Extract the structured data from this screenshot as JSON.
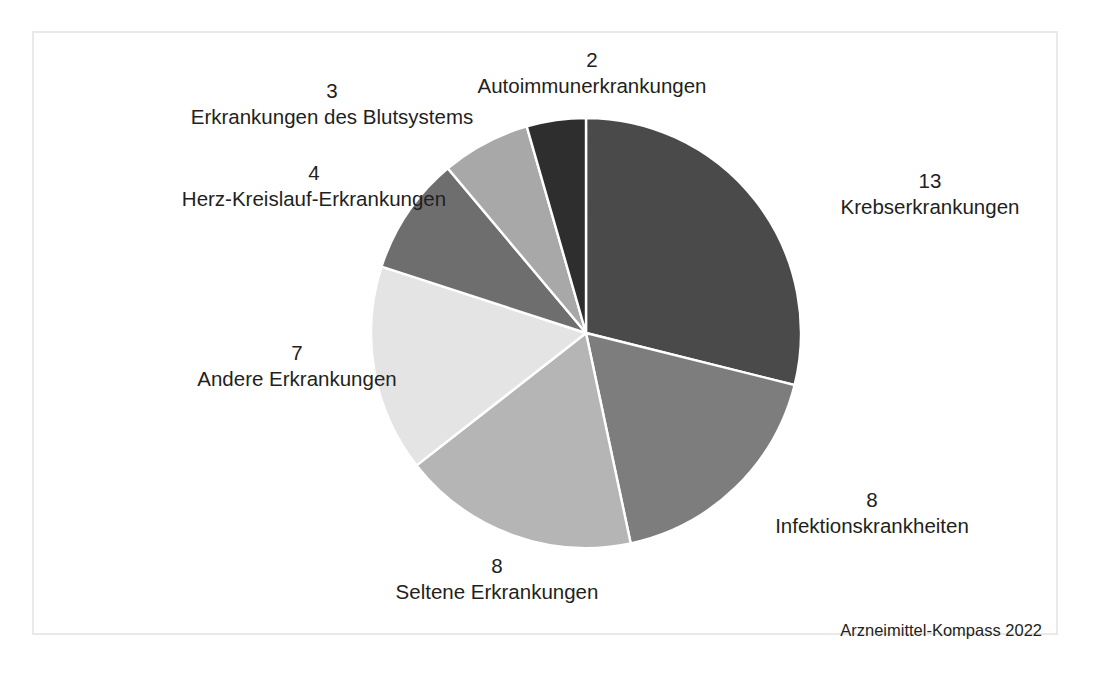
{
  "figure": {
    "source_note": "Arzneimittel-Kompass 2022",
    "frame_color": "#e9e9e9",
    "background_color": "#ffffff",
    "text_color": "#231f20"
  },
  "chart_data": {
    "type": "pie",
    "title": "",
    "subtitle": "",
    "xlabel": "",
    "ylabel": "",
    "total": 45,
    "start_angle_deg": 0,
    "direction": "clockwise",
    "legend_position": "outside-labels",
    "grid": false,
    "annotations": [
      "Arzneimittel-Kompass 2022"
    ],
    "categories": [
      "Krebserkrankungen",
      "Infektionskrankheiten",
      "Seltene Erkrankungen",
      "Andere Erkrankungen",
      "Herz-Kreislauf-Erkrankungen",
      "Erkrankungen des Blutsystems",
      "Autoimmunerkrankungen"
    ],
    "values": [
      13,
      8,
      8,
      7,
      4,
      3,
      2
    ],
    "colors": [
      "#4a4a4a",
      "#7d7d7d",
      "#b5b5b5",
      "#e4e4e4",
      "#6e6e6e",
      "#a8a8a8",
      "#2e2e2e"
    ],
    "slices": [
      {
        "label": "Krebserkrankungen",
        "value": 13,
        "color": "#4a4a4a"
      },
      {
        "label": "Infektionskrankheiten",
        "value": 8,
        "color": "#7d7d7d"
      },
      {
        "label": "Seltene Erkrankungen",
        "value": 8,
        "color": "#b5b5b5"
      },
      {
        "label": "Andere Erkrankungen",
        "value": 7,
        "color": "#e4e4e4"
      },
      {
        "label": "Herz-Kreislauf-Erkrankungen",
        "value": 4,
        "color": "#6e6e6e"
      },
      {
        "label": "Erkrankungen des Blutsystems",
        "value": 3,
        "color": "#a8a8a8"
      },
      {
        "label": "Autoimmunerkrankungen",
        "value": 2,
        "color": "#2e2e2e"
      }
    ]
  },
  "labels": {
    "autoimmun": {
      "value": "2",
      "name": "Autoimmunerkrankungen"
    },
    "blutsystem": {
      "value": "3",
      "name": "Erkrankungen des Blutsystems"
    },
    "herzkreislauf": {
      "value": "4",
      "name": "Herz-Kreislauf-Erkrankungen"
    },
    "andere": {
      "value": "7",
      "name": "Andere Erkrankungen"
    },
    "seltene": {
      "value": "8",
      "name": "Seltene Erkrankungen"
    },
    "infektion": {
      "value": "8",
      "name": "Infektionskrankheiten"
    },
    "krebs": {
      "value": "13",
      "name": "Krebserkrankungen"
    }
  }
}
